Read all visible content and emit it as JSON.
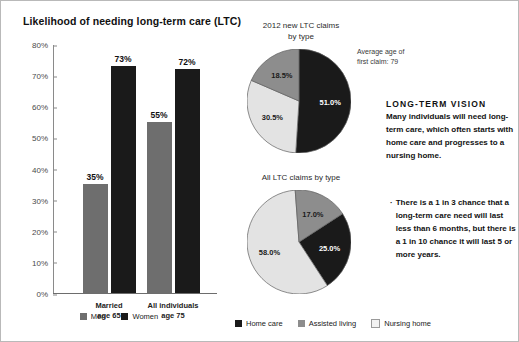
{
  "chart_data": [
    {
      "type": "bar",
      "title": "Likelihood of needing long-term care (LTC)",
      "xlabel": "",
      "ylabel": "",
      "ylim": [
        0,
        80
      ],
      "ytick_labels": [
        "0%",
        "10%",
        "20%",
        "30%",
        "40%",
        "50%",
        "60%",
        "70%",
        "80%"
      ],
      "ytick_values": [
        0,
        10,
        20,
        30,
        40,
        50,
        60,
        70,
        80
      ],
      "grid": false,
      "categories": [
        "Married\nage 65",
        "All individuals\nage 75"
      ],
      "category_labels": [
        {
          "line1": "Married",
          "line2": "age 65"
        },
        {
          "line1": "All individuals",
          "line2": "age 75"
        }
      ],
      "series": [
        {
          "name": "Men",
          "color": "#6e6e6e",
          "values": [
            35,
            55
          ],
          "value_labels": [
            "35%",
            "55%"
          ]
        },
        {
          "name": "Women",
          "color": "#1a1a1a",
          "values": [
            73,
            72
          ],
          "value_labels": [
            "73%",
            "72%"
          ]
        }
      ],
      "legend_position": "bottom"
    },
    {
      "type": "pie",
      "title_line1": "2012 new LTC claims",
      "title_line2": "by type",
      "labels": [
        "Home care",
        "Assisted living",
        "Nursing home"
      ],
      "values": [
        51.0,
        30.5,
        18.5
      ],
      "value_labels": [
        "51.0%",
        "30.5%",
        "18.5%"
      ],
      "colors": [
        "#1a1a1a",
        "#e3e3e3",
        "#8d8d8d"
      ],
      "annotation_line1": "Average age of",
      "annotation_line2": "first claim: 79"
    },
    {
      "type": "pie",
      "title_line1": "All LTC claims by type",
      "title_line2": "",
      "labels": [
        "Home care",
        "Assisted living",
        "Nursing home"
      ],
      "values": [
        25.0,
        58.0,
        17.0
      ],
      "value_labels": [
        "25.0%",
        "58.0%",
        "17.0%"
      ],
      "colors": [
        "#1a1a1a",
        "#e3e3e3",
        "#8d8d8d"
      ]
    }
  ],
  "bar_chart": {
    "title": "Likelihood of needing long-term care (LTC)",
    "ticks": [
      "80%",
      "70%",
      "60%",
      "50%",
      "40%",
      "30%",
      "20%",
      "10%",
      "0%"
    ],
    "bars": [
      {
        "label": "35%",
        "series": "Men",
        "value": 35,
        "group": 0
      },
      {
        "label": "73%",
        "series": "Women",
        "value": 73,
        "group": 0
      },
      {
        "label": "55%",
        "series": "Men",
        "value": 55,
        "group": 1
      },
      {
        "label": "72%",
        "series": "Women",
        "value": 72,
        "group": 1
      }
    ],
    "groups": [
      {
        "line1": "Married",
        "line2": "age 65"
      },
      {
        "line1": "All individuals",
        "line2": "age 75"
      }
    ],
    "legend": [
      {
        "label": "Men",
        "color": "#6e6e6e"
      },
      {
        "label": "Women",
        "color": "#1a1a1a"
      }
    ]
  },
  "pie1": {
    "title_line1": "2012 new LTC claims",
    "title_line2": "by type",
    "slices": [
      {
        "label": "51.0%",
        "value": 51.0,
        "color": "#1a1a1a",
        "text_color": "#ffffff"
      },
      {
        "label": "30.5%",
        "value": 30.5,
        "color": "#e3e3e3",
        "text_color": "#1a1a1a"
      },
      {
        "label": "18.5%",
        "value": 18.5,
        "color": "#8d8d8d",
        "text_color": "#1a1a1a"
      }
    ]
  },
  "pie2": {
    "title_line1": "All LTC claims by type",
    "slices": [
      {
        "label": "25.0%",
        "value": 25.0,
        "color": "#1a1a1a",
        "text_color": "#ffffff"
      },
      {
        "label": "58.0%",
        "value": 58.0,
        "color": "#e3e3e3",
        "text_color": "#1a1a1a"
      },
      {
        "label": "17.0%",
        "value": 17.0,
        "color": "#8d8d8d",
        "text_color": "#1a1a1a"
      }
    ]
  },
  "pie_legend": [
    {
      "label": "Home care",
      "color": "#1a1a1a"
    },
    {
      "label": "Assisted living",
      "color": "#8d8d8d"
    },
    {
      "label": "Nursing home",
      "color": "#f2f2f2"
    }
  ],
  "annotation": {
    "line1": "Average age of",
    "line2": "first claim: 79"
  },
  "vision": {
    "heading": "LONG-TERM VISION",
    "body": "Many individuals will need long-term care, which often starts with home care and progresses to a nursing home."
  },
  "bullet": {
    "marker": "·",
    "text": "There is a 1 in 3 chance that a long-term care need will last less than 6 months, but there is a 1 in 10 chance it will last 5 or more years."
  }
}
